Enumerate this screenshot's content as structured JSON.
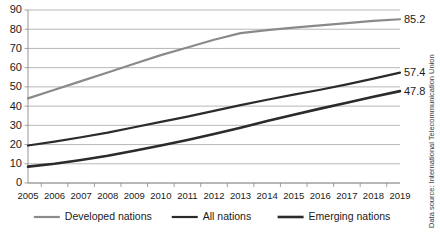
{
  "chart_data": {
    "type": "line",
    "title": "",
    "subtitle": "",
    "xlabel": "",
    "ylabel": "",
    "grid": true,
    "legend_position": "bottom",
    "ylim": [
      0,
      90
    ],
    "ytick_step": 10,
    "yticks": [
      "0",
      "10",
      "20",
      "30",
      "40",
      "50",
      "60",
      "70",
      "80",
      "90"
    ],
    "categories": [
      "2005",
      "2006",
      "2007",
      "2008",
      "2009",
      "2010",
      "2011",
      "2012",
      "2013",
      "2014",
      "2015",
      "2016",
      "2017",
      "2018",
      "2019"
    ],
    "series": [
      {
        "name": "Developed nations",
        "color": "#8a8a8a",
        "width": 2.2,
        "end_label": "85.2",
        "values": [
          44.0,
          48.5,
          53.0,
          57.5,
          62.0,
          66.5,
          70.5,
          74.5,
          78.0,
          79.5,
          80.8,
          82.0,
          83.2,
          84.3,
          85.2
        ]
      },
      {
        "name": "All nations",
        "color": "#2b2b2b",
        "width": 2.2,
        "end_label": "57.4",
        "values": [
          19.5,
          21.5,
          23.8,
          26.2,
          29.0,
          31.8,
          34.5,
          37.5,
          40.5,
          43.3,
          46.0,
          48.5,
          51.3,
          54.3,
          57.4
        ]
      },
      {
        "name": "Emerging nations",
        "color": "#2b2b2b",
        "width": 2.6,
        "end_label": "47.8",
        "values": [
          8.5,
          10.0,
          12.0,
          14.2,
          16.8,
          19.5,
          22.4,
          25.5,
          28.8,
          32.2,
          35.5,
          38.7,
          41.8,
          44.9,
          47.8
        ]
      }
    ],
    "data_labels": [
      "85.2",
      "57.4",
      "47.8"
    ]
  },
  "legend": {
    "items": [
      {
        "label": "Developed nations"
      },
      {
        "label": "All nations"
      },
      {
        "label": "Emerging nations"
      }
    ]
  },
  "source": {
    "text": "Data source: International Telecommunication Union"
  }
}
